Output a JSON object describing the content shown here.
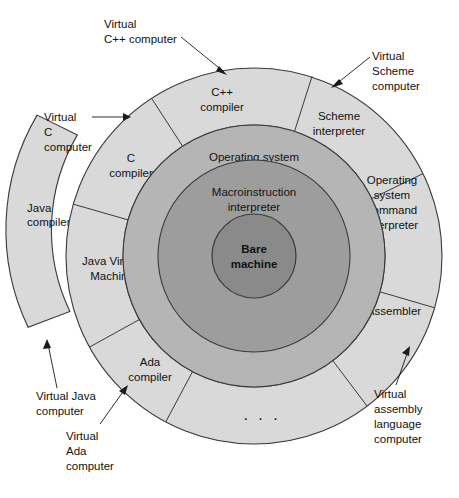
{
  "figure": {
    "type": "concentric-layered-diagram",
    "center": {
      "x": 254,
      "y": 256
    },
    "background_color": "#ffffff",
    "colors": {
      "outer_ring": "#d9d9d9",
      "middle_ring": "#b5b5b5",
      "inner_ring": "#9d9d9d",
      "core": "#8a8a8a",
      "stroke": "#3a3a3a",
      "text": "#111111"
    }
  },
  "core": {
    "label_line1": "Bare",
    "label_line2": "machine",
    "radius": 42
  },
  "rings": [
    {
      "name": "inner-ring",
      "label_line1": "Macroinstruction",
      "label_line2": "interpreter",
      "inner_radius": 42,
      "outer_radius": 96
    },
    {
      "name": "middle-ring",
      "label_line1": "Operating system",
      "label_line2": "",
      "inner_radius": 96,
      "outer_radius": 131
    }
  ],
  "outer_ring": {
    "inner_radius": 131,
    "outer_radius": 188,
    "sectors": [
      {
        "id": "cpp-compiler",
        "line1": "C++",
        "line2": "compiler",
        "line3": "",
        "line4": ""
      },
      {
        "id": "scheme-interpreter",
        "line1": "Scheme",
        "line2": "interpreter",
        "line3": "",
        "line4": ""
      },
      {
        "id": "os-command-interpreter",
        "line1": "Operating",
        "line2": "system",
        "line3": "command",
        "line4": "interpreter"
      },
      {
        "id": "assembler",
        "line1": "Assembler",
        "line2": "",
        "line3": "",
        "line4": ""
      },
      {
        "id": "more-sectors",
        "line1": ". . .",
        "line2": "",
        "line3": "",
        "line4": ""
      },
      {
        "id": "ada-compiler",
        "line1": "Ada",
        "line2": "compiler",
        "line3": "",
        "line4": ""
      },
      {
        "id": "java-virtual-machine",
        "line1": "Java Virtual",
        "line2": "Machine",
        "line3": "",
        "line4": ""
      },
      {
        "id": "c-compiler",
        "line1": "C",
        "line2": "compiler",
        "line3": "",
        "line4": ""
      }
    ]
  },
  "extra_ring": {
    "id": "java-compiler-arc",
    "inner_radius": 188,
    "outer_radius": 226,
    "line1": "Java",
    "line2": "compiler"
  },
  "callouts": [
    {
      "id": "virtual-cpp-computer",
      "line1": "Virtual",
      "line2": "C++ computer",
      "line3": "",
      "text_x": 104,
      "text_y": 28
    },
    {
      "id": "virtual-scheme-computer",
      "line1": "Virtual",
      "line2": "Scheme",
      "line3": "computer",
      "text_x": 372,
      "text_y": 60
    },
    {
      "id": "virtual-c-computer",
      "line1": "Virtual",
      "line2": "C",
      "line3": "computer",
      "text_x": 44,
      "text_y": 118
    },
    {
      "id": "virtual-java-computer",
      "line1": "Virtual Java",
      "line2": "computer",
      "line3": "",
      "text_x": 36,
      "text_y": 400
    },
    {
      "id": "virtual-ada-computer",
      "line1": "Virtual",
      "line2": "Ada",
      "line3": "computer",
      "text_x": 66,
      "text_y": 440
    },
    {
      "id": "virtual-assembly-language-computer",
      "line1": "Virtual",
      "line2": "assembly",
      "line3": "language",
      "line4": "computer",
      "text_x": 374,
      "text_y": 398
    }
  ]
}
